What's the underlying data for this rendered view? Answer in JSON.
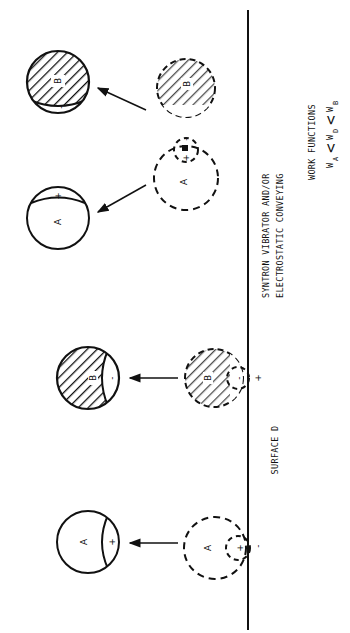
{
  "figure": {
    "surface_label": "SURFACE D",
    "conveying_label_line1": "SYNTRON VIBRATOR AND/OR",
    "conveying_label_line2": "ELECTROSTATIC CONVEYING",
    "work_functions_title": "WORK FUNCTIONS",
    "work_functions_formula": {
      "w_a": "W",
      "sub_a": "A",
      "lt1": "<",
      "w_d": "W",
      "sub_d": "D",
      "lt2": "<",
      "w_b": "W",
      "sub_b": "B"
    },
    "particles": {
      "a_label": "A",
      "b_label": "B",
      "plus": "+",
      "minus": "-"
    },
    "colors": {
      "ink": "#111111",
      "background": "#ffffff"
    }
  }
}
